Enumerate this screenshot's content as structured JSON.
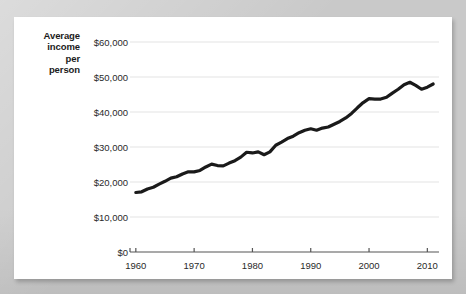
{
  "figure": {
    "y_axis_title_lines": [
      "Average",
      "income",
      "per",
      "person"
    ],
    "background_color": "#c9c9c9",
    "card_color": "#ffffff",
    "line_color": "#1a1a1a",
    "grid_color": "#e3e3e3",
    "axis_color": "#555555",
    "text_color": "#2a2a2a"
  },
  "chart_data": {
    "type": "line",
    "title": "",
    "subtitle": "",
    "xlabel": "",
    "ylabel": "Average income per person",
    "xlim": [
      1959,
      2012
    ],
    "ylim": [
      0,
      60000
    ],
    "grid": true,
    "legend": false,
    "y_tick_labels": [
      "$0",
      "$10,000",
      "$20,000",
      "$30,000",
      "$40,000",
      "$50,000",
      "$60,000"
    ],
    "y_ticks": [
      0,
      10000,
      20000,
      30000,
      40000,
      50000,
      60000
    ],
    "x_tick_labels": [
      "1960",
      "1970",
      "1980",
      "1990",
      "2000",
      "2010"
    ],
    "x_ticks": [
      1960,
      1970,
      1980,
      1990,
      2000,
      2010
    ],
    "series": [
      {
        "name": "Average income per person",
        "x": [
          1960,
          1961,
          1962,
          1963,
          1964,
          1965,
          1966,
          1967,
          1968,
          1969,
          1970,
          1971,
          1972,
          1973,
          1974,
          1975,
          1976,
          1977,
          1978,
          1979,
          1980,
          1981,
          1982,
          1983,
          1984,
          1985,
          1986,
          1987,
          1988,
          1989,
          1990,
          1991,
          1992,
          1993,
          1994,
          1995,
          1996,
          1997,
          1998,
          1999,
          2000,
          2001,
          2002,
          2003,
          2004,
          2005,
          2006,
          2007,
          2008,
          2009,
          2010,
          2011
        ],
        "values": [
          17000,
          17200,
          18000,
          18500,
          19400,
          20200,
          21100,
          21500,
          22300,
          22900,
          22900,
          23300,
          24300,
          25100,
          24700,
          24600,
          25400,
          26100,
          27100,
          28500,
          28300,
          28600,
          27800,
          28600,
          30500,
          31400,
          32400,
          33100,
          34100,
          34800,
          35200,
          34800,
          35400,
          35700,
          36500,
          37300,
          38300,
          39600,
          41200,
          42700,
          43800,
          43700,
          43700,
          44200,
          45400,
          46500,
          47800,
          48500,
          47600,
          46500,
          47100,
          48000
        ]
      }
    ],
    "annotations": []
  }
}
